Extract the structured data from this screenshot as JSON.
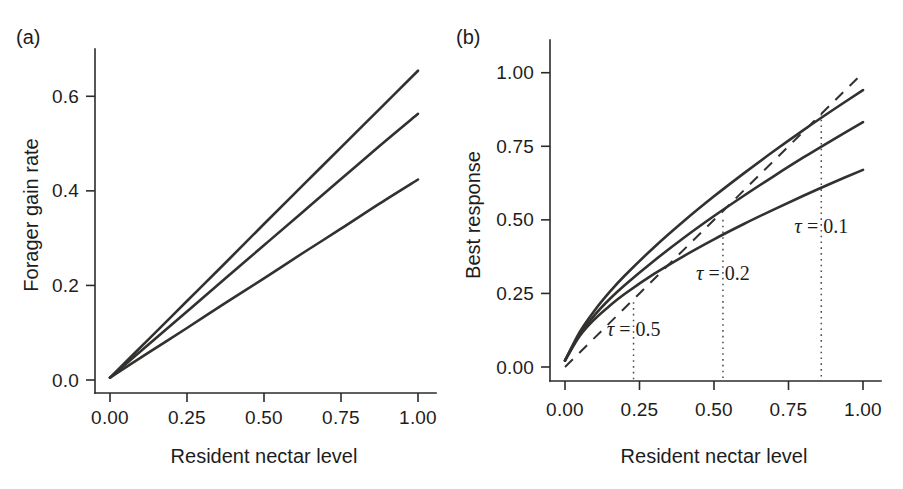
{
  "figure": {
    "width": 903,
    "height": 489,
    "background": "#ffffff",
    "ink_color": "#33312f"
  },
  "panels": [
    {
      "id": "a",
      "label": "(a)",
      "xlabel": "Resident nectar level",
      "ylabel": "Forager gain rate"
    },
    {
      "id": "b",
      "label": "(b)",
      "xlabel": "Resident nectar level",
      "ylabel": "Best response"
    }
  ],
  "chart_data": [
    {
      "type": "line",
      "panel": "a",
      "title": "",
      "xlabel": "Resident nectar level",
      "ylabel": "Forager gain rate",
      "xlim": [
        0.0,
        1.0
      ],
      "ylim": [
        0.0,
        0.7
      ],
      "xticks": [
        0.0,
        0.25,
        0.5,
        0.75,
        1.0
      ],
      "xticklabels": [
        "0.00",
        "0.25",
        "0.50",
        "0.75",
        "1.00"
      ],
      "yticks": [
        0.0,
        0.2,
        0.4,
        0.6
      ],
      "yticklabels": [
        "0.0",
        "0.2",
        "0.4",
        "0.6"
      ],
      "grid": false,
      "legend": "none",
      "series": [
        {
          "name": "tau = 0.1",
          "style": "solid",
          "x": [
            0.0,
            0.125,
            0.25,
            0.375,
            0.5,
            0.625,
            0.75,
            0.875,
            1.0
          ],
          "values": [
            0.005,
            0.086,
            0.167,
            0.248,
            0.33,
            0.411,
            0.492,
            0.573,
            0.654
          ]
        },
        {
          "name": "tau = 0.2",
          "style": "solid",
          "x": [
            0.0,
            0.125,
            0.25,
            0.375,
            0.5,
            0.625,
            0.75,
            0.875,
            1.0
          ],
          "values": [
            0.005,
            0.075,
            0.145,
            0.215,
            0.285,
            0.355,
            0.425,
            0.495,
            0.563
          ]
        },
        {
          "name": "tau = 0.5",
          "style": "solid",
          "x": [
            0.0,
            0.125,
            0.25,
            0.375,
            0.5,
            0.625,
            0.75,
            0.875,
            1.0
          ],
          "values": [
            0.005,
            0.058,
            0.11,
            0.163,
            0.215,
            0.268,
            0.32,
            0.373,
            0.424
          ]
        }
      ]
    },
    {
      "type": "line",
      "panel": "b",
      "title": "",
      "xlabel": "Resident nectar level",
      "ylabel": "Best response",
      "xlim": [
        0.0,
        1.0
      ],
      "ylim": [
        0.0,
        1.05
      ],
      "xticks": [
        0.0,
        0.25,
        0.5,
        0.75,
        1.0
      ],
      "xticklabels": [
        "0.00",
        "0.25",
        "0.50",
        "0.75",
        "1.00"
      ],
      "yticks": [
        0.0,
        0.25,
        0.5,
        0.75,
        1.0
      ],
      "yticklabels": [
        "0.00",
        "0.25",
        "0.50",
        "0.75",
        "1.00"
      ],
      "grid": false,
      "legend": "none",
      "series": [
        {
          "name": "tau = 0.1",
          "style": "solid",
          "x": [
            0.0,
            0.05,
            0.1,
            0.15,
            0.2,
            0.3,
            0.4,
            0.5,
            0.6,
            0.7,
            0.8,
            0.9,
            1.0
          ],
          "values": [
            0.022,
            0.112,
            0.177,
            0.231,
            0.278,
            0.362,
            0.44,
            0.513,
            0.582,
            0.648,
            0.712,
            0.773,
            0.832
          ]
        },
        {
          "name": "tau = 0.2",
          "style": "solid",
          "x": [
            0.0,
            0.05,
            0.1,
            0.15,
            0.2,
            0.3,
            0.4,
            0.5,
            0.6,
            0.7,
            0.8,
            0.9,
            1.0
          ],
          "values": [
            0.022,
            0.106,
            0.163,
            0.208,
            0.248,
            0.317,
            0.378,
            0.434,
            0.486,
            0.535,
            0.582,
            0.627,
            0.67
          ]
        },
        {
          "name": "tau = 0.5",
          "style": "solid",
          "x": [
            0.0,
            0.05,
            0.1,
            0.15,
            0.2,
            0.3,
            0.4,
            0.5,
            0.6,
            0.7,
            0.8,
            0.9,
            1.0
          ],
          "values": [
            0.022,
            0.12,
            0.193,
            0.255,
            0.31,
            0.408,
            0.497,
            0.58,
            0.658,
            0.733,
            0.805,
            0.874,
            0.941
          ]
        },
        {
          "name": "diagonal",
          "style": "dashed",
          "x": [
            0.0,
            1.0
          ],
          "values": [
            0.0,
            1.0
          ]
        }
      ],
      "annotations": [
        {
          "text_tau": "τ",
          "text_rest": " = 0.5",
          "x": 0.23,
          "y": 0.105,
          "line_top": 0.22
        },
        {
          "text_tau": "τ",
          "text_rest": " = 0.2",
          "x": 0.53,
          "y": 0.295,
          "line_top": 0.5
        },
        {
          "text_tau": "τ",
          "text_rest": " = 0.1",
          "x": 0.86,
          "y": 0.455,
          "line_top": 0.86
        }
      ]
    }
  ]
}
